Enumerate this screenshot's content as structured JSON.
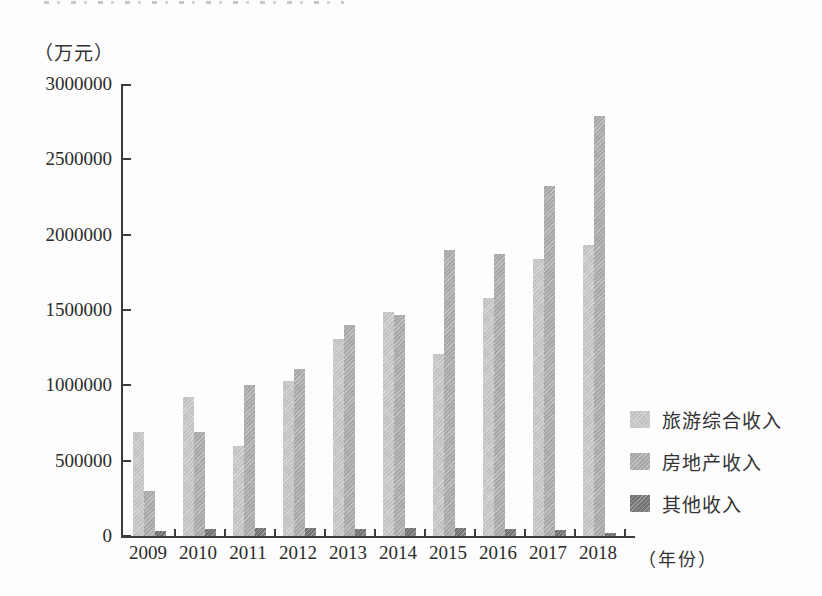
{
  "figure": {
    "kind": "scanned textbook bar chart",
    "background_color": "#fdfdfd",
    "axis_color": "#3c3c3c",
    "text_color": "#2b2b2b"
  },
  "chart_data": {
    "type": "bar",
    "title": "",
    "ylabel": "（万元）",
    "xlabel": "（年份）",
    "categories": [
      "2009",
      "2010",
      "2011",
      "2012",
      "2013",
      "2014",
      "2015",
      "2016",
      "2017",
      "2018"
    ],
    "series": [
      {
        "name": "旅游综合收入",
        "color": "#c9c9c9",
        "values": [
          690000,
          920000,
          600000,
          1030000,
          1310000,
          1490000,
          1210000,
          1580000,
          1840000,
          1930000
        ]
      },
      {
        "name": "房地产收入",
        "color": "#adadad",
        "values": [
          300000,
          690000,
          1000000,
          1110000,
          1400000,
          1470000,
          1900000,
          1870000,
          2320000,
          2790000
        ]
      },
      {
        "name": "其他收入",
        "color": "#757575",
        "values": [
          35000,
          45000,
          55000,
          50000,
          45000,
          55000,
          55000,
          45000,
          40000,
          20000
        ]
      }
    ],
    "ylim": [
      0,
      3000000
    ],
    "yticks": [
      0,
      500000,
      1000000,
      1500000,
      2000000,
      2500000,
      3000000
    ],
    "ytick_labels": [
      "0",
      "500000",
      "1000000",
      "1500000",
      "2000000",
      "2500000",
      "3000000"
    ],
    "grid": false,
    "legend_position": "right"
  }
}
